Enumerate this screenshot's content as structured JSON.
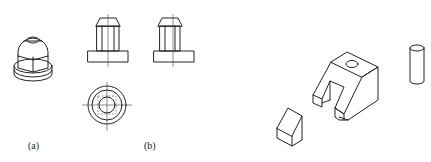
{
  "figure": {
    "header_text_cropped": "",
    "panels": [
      {
        "id": "a",
        "label": "(a)",
        "description": "isometric view of stepped cylindrical part with hexagonal body"
      },
      {
        "id": "b",
        "label": "(b)",
        "description": "orthographic views: front, side, and top"
      }
    ],
    "right_group": {
      "description": "isometric views of a slotted block with a hole, a wedge piece, and a cylinder pin"
    }
  }
}
